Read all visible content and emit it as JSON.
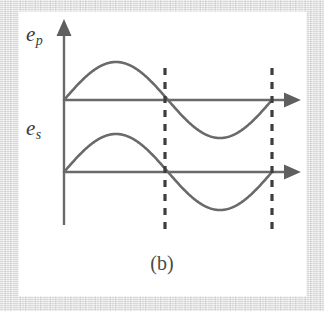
{
  "figure": {
    "caption": "(b)",
    "background_color": "#d8d8d8",
    "panel_color": "#ffffff",
    "stroke_color": "#6a6a6a",
    "text_color": "#3a3a3a"
  },
  "labels": {
    "primary": {
      "base": "e",
      "subscript": "p"
    },
    "secondary": {
      "base": "e",
      "subscript": "s"
    }
  },
  "chart_data": {
    "type": "line",
    "title": "(b)",
    "xlabel": "",
    "ylabel": "",
    "grid": false,
    "legend": null,
    "axis": {
      "vertical_axis_x": 64,
      "vertical_axis_top_y": 28,
      "vertical_axis_bottom_y": 225,
      "x_start": 64,
      "x_end": 290,
      "arrow_heads": [
        "vertical-top",
        "horizontal-right-upper",
        "horizontal-right-lower"
      ]
    },
    "annotations": [
      {
        "name": "dashed-marker-1",
        "type": "vertical-dashed-line",
        "x": 165,
        "y_top": 68,
        "y_bottom": 232
      },
      {
        "name": "dashed-marker-2",
        "type": "vertical-dashed-line",
        "x": 272,
        "y_top": 68,
        "y_bottom": 232
      }
    ],
    "series": [
      {
        "name": "e_p",
        "baseline_y": 100,
        "amplitude": 38,
        "period_px": 208,
        "phase": 0,
        "x_start": 64,
        "x_end": 272,
        "x": [
          0,
          0.125,
          0.25,
          0.375,
          0.5,
          0.625,
          0.75,
          0.875,
          1.0
        ],
        "values": [
          0,
          0.707,
          1.0,
          0.707,
          0,
          -0.707,
          -1.0,
          -0.707,
          0
        ]
      },
      {
        "name": "e_s",
        "baseline_y": 172,
        "amplitude": 38,
        "period_px": 208,
        "phase": 0,
        "x_start": 64,
        "x_end": 272,
        "x": [
          0,
          0.125,
          0.25,
          0.375,
          0.5,
          0.625,
          0.75,
          0.875,
          1.0
        ],
        "values": [
          0,
          0.707,
          1.0,
          0.707,
          0,
          -0.707,
          -1.0,
          -0.707,
          0
        ]
      }
    ],
    "xlim": [
      0,
      1
    ],
    "ylim": [
      -1,
      1
    ]
  }
}
